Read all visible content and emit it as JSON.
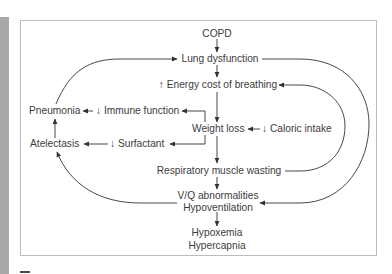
{
  "diagram": {
    "nodes": {
      "copd": "COPD",
      "lung_dysfunction": "Lung dysfunction",
      "energy_cost": "↑ Energy cost of breathing",
      "pneumonia": "Pneumonia",
      "immune_function": "↓ Immune function",
      "weight_loss": "Weight loss",
      "caloric_intake": "↓ Caloric intake",
      "atelectasis": "Atelectasis",
      "surfactant": "↓ Surfactant",
      "resp_muscle_wasting": "Respiratory muscle wasting",
      "vq_abnormalities": "V/Q abnormalities",
      "hypoventilation": "Hypoventilation",
      "hypoxemia": "Hypoxemia",
      "hypercapnia": "Hypercapnia"
    },
    "edges": [
      [
        "COPD",
        "Lung dysfunction"
      ],
      [
        "Lung dysfunction",
        "↑ Energy cost of breathing"
      ],
      [
        "↑ Energy cost of breathing",
        "Weight loss"
      ],
      [
        "↓ Caloric intake",
        "Weight loss"
      ],
      [
        "Weight loss",
        "↓ Immune function"
      ],
      [
        "↓ Immune function",
        "Pneumonia"
      ],
      [
        "Weight loss",
        "↓ Surfactant"
      ],
      [
        "↓ Surfactant",
        "Atelectasis"
      ],
      [
        "Atelectasis",
        "Pneumonia"
      ],
      [
        "Pneumonia",
        "Lung dysfunction"
      ],
      [
        "Weight loss",
        "Respiratory muscle wasting"
      ],
      [
        "Respiratory muscle wasting",
        "↑ Energy cost of breathing"
      ],
      [
        "Respiratory muscle wasting",
        "V/Q abnormalities / Hypoventilation"
      ],
      [
        "Lung dysfunction",
        "V/Q abnormalities / Hypoventilation"
      ],
      [
        "V/Q abnormalities / Hypoventilation",
        "Atelectasis"
      ],
      [
        "V/Q abnormalities / Hypoventilation",
        "Hypoxemia / Hypercapnia"
      ]
    ]
  },
  "colors": {
    "line": "#333333",
    "frame": "#bdbdbd",
    "strip": "#a9a9a9",
    "text": "#3c3c3c"
  }
}
